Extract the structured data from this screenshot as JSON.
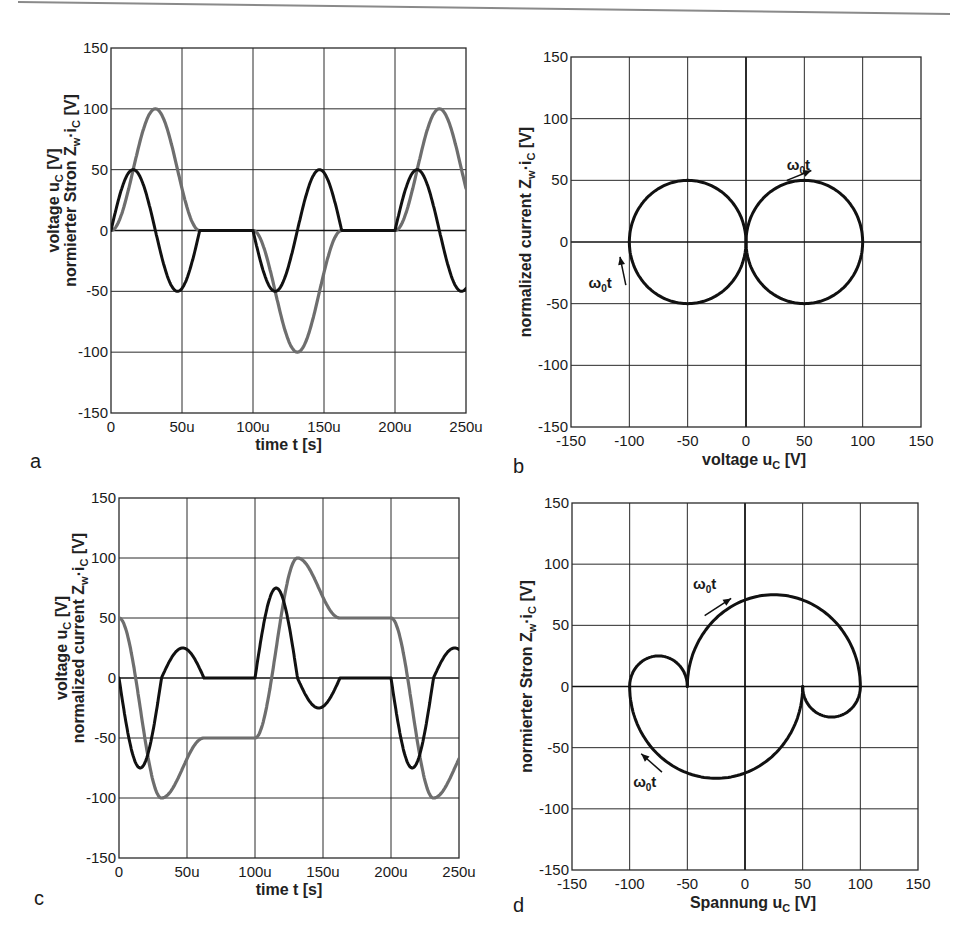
{
  "header": {
    "rule_color": "#8a8a8a"
  },
  "colors": {
    "current": "#111111",
    "voltage": "#6e6e6e"
  },
  "chart_data": [
    {
      "id": "a",
      "panel_label": "a",
      "type": "line",
      "xlabel": "time   t   [s]",
      "ylabel_line1": "voltage   u",
      "ylabel_line1_sub": "C",
      "ylabel_line1_unit": "[V]",
      "ylabel_line2": "normierter Stron   Z",
      "ylabel_line2_sub_w": "w",
      "ylabel_line2_mid": "·i",
      "ylabel_line2_sub_c": "C",
      "ylabel_line2_unit": "[V]",
      "xlim": [
        0,
        250
      ],
      "ylim": [
        -150,
        150
      ],
      "x_unit": "us",
      "xticks": [
        0,
        50,
        100,
        150,
        200,
        250
      ],
      "xtick_labels": [
        "0",
        "50u",
        "100u",
        "150u",
        "200u",
        "250u"
      ],
      "yticks": [
        150,
        100,
        50,
        0,
        -50,
        -100,
        -150
      ],
      "ytick_labels": [
        "150",
        "100",
        "50",
        "0",
        "-50",
        "-100",
        "-150"
      ],
      "grid": true,
      "resonant_period_us": 62.5,
      "series": [
        {
          "name": "u_C (voltage)",
          "color_key": "voltage",
          "segments": [
            {
              "t0": 0,
              "kind": "arc",
              "center_u": -50,
              "center_i": 0,
              "radius": 50,
              "start_deg": 0,
              "sweep_deg": 360,
              "sign": -1
            },
            {
              "t0": 62.5,
              "kind": "hold",
              "u": 0,
              "t1": 100
            },
            {
              "t0": 100,
              "kind": "arc",
              "center_u": 50,
              "center_i": 0,
              "radius": 50,
              "start_deg": 180,
              "sweep_deg": 360,
              "sign": 1
            },
            {
              "t0": 162.5,
              "kind": "hold",
              "u": 0,
              "t1": 200
            },
            {
              "t0": 200,
              "kind": "arc",
              "center_u": -50,
              "center_i": 0,
              "radius": 50,
              "start_deg": 0,
              "sweep_deg": 360,
              "sign": -1
            }
          ]
        },
        {
          "name": "Z_w·i_C (normalized current)",
          "color_key": "current"
        }
      ],
      "key_points": {
        "u_min": -100,
        "u_max": 100,
        "i_peak": 50
      }
    },
    {
      "id": "b",
      "panel_label": "b",
      "type": "line",
      "xlabel": "voltage   u",
      "xlabel_sub": "C",
      "xlabel_unit": "[V]",
      "ylabel": "normalized current   Z",
      "ylabel_sub_w": "w",
      "ylabel_mid": "·i",
      "ylabel_sub_c": "C",
      "ylabel_unit": "[V]",
      "xlim": [
        -150,
        150
      ],
      "ylim": [
        -150,
        150
      ],
      "xticks": [
        -150,
        -100,
        -50,
        0,
        50,
        100,
        150
      ],
      "xtick_labels": [
        "-150",
        "-100",
        "-50",
        "0",
        "50",
        "100",
        "150"
      ],
      "yticks": [
        150,
        100,
        50,
        0,
        -50,
        -100,
        -150
      ],
      "ytick_labels": [
        "150",
        "100",
        "50",
        "0",
        "-50",
        "-100",
        "-150"
      ],
      "grid": true,
      "circles": [
        {
          "center_u": -50,
          "center_i": 0,
          "radius": 50
        },
        {
          "center_u": 50,
          "center_i": 0,
          "radius": 50
        }
      ],
      "annotations": [
        {
          "text": "ω",
          "sub": "0",
          "tail": "t",
          "at_u": 35,
          "at_i": 58,
          "arrow_from": [
            35,
            50
          ],
          "arrow_to": [
            56,
            58
          ]
        },
        {
          "text": "ω",
          "sub": "0",
          "tail": "t",
          "at_u": -135,
          "at_i": -37,
          "arrow_from": [
            -103,
            -35
          ],
          "arrow_to": [
            -108,
            -12
          ]
        }
      ]
    },
    {
      "id": "c",
      "panel_label": "c",
      "type": "line",
      "xlabel": "time   t   [s]",
      "ylabel_line1": "voltage   u",
      "ylabel_line1_sub": "C",
      "ylabel_line1_unit": "[V]",
      "ylabel_line2": "normalized current   Z",
      "ylabel_line2_sub_w": "w",
      "ylabel_line2_mid": "·i",
      "ylabel_line2_sub_c": "C",
      "ylabel_line2_unit": "[V]",
      "xlim": [
        0,
        250
      ],
      "ylim": [
        -150,
        150
      ],
      "x_unit": "us",
      "xticks": [
        0,
        50,
        100,
        150,
        200,
        250
      ],
      "xtick_labels": [
        "0",
        "50u",
        "100u",
        "150u",
        "200u",
        "250u"
      ],
      "yticks": [
        150,
        100,
        50,
        0,
        -50,
        -100,
        -150
      ],
      "ytick_labels": [
        "150",
        "100",
        "50",
        "0",
        "-50",
        "-100",
        "-150"
      ],
      "grid": true,
      "resonant_period_us": 62.5,
      "segments": [
        {
          "t0": 0,
          "dur": 31.25,
          "center_u": -25,
          "radius": 75,
          "start_deg": 0,
          "dir": -1
        },
        {
          "t0": 31.25,
          "dur": 31.25,
          "center_u": -75,
          "radius": 25,
          "start_deg": 180,
          "dir": -1
        },
        {
          "t0": 62.5,
          "dur": 37.5,
          "hold_u": -50
        },
        {
          "t0": 100,
          "dur": 31.25,
          "center_u": 25,
          "radius": 75,
          "start_deg": 180,
          "dir": -1
        },
        {
          "t0": 131.25,
          "dur": 31.25,
          "center_u": 75,
          "radius": 25,
          "start_deg": 0,
          "dir": -1
        },
        {
          "t0": 162.5,
          "dur": 37.5,
          "hold_u": 50
        },
        {
          "t0": 200,
          "dur": 31.25,
          "center_u": -25,
          "radius": 75,
          "start_deg": 0,
          "dir": -1
        },
        {
          "t0": 231.25,
          "dur": 31.25,
          "center_u": -75,
          "radius": 25,
          "start_deg": 180,
          "dir": -1
        }
      ],
      "key_points": {
        "u_start": 50,
        "u_min": -100,
        "u_hold_1": -50,
        "u_max": 100,
        "u_hold_2": 50,
        "i_min": -75,
        "i_max": 75,
        "i_small_peak": 25
      }
    },
    {
      "id": "d",
      "panel_label": "d",
      "type": "line",
      "xlabel": "Spannung   u",
      "xlabel_sub": "C",
      "xlabel_unit": "[V]",
      "ylabel": "normierter Stron   Z",
      "ylabel_sub_w": "w",
      "ylabel_mid": "·i",
      "ylabel_sub_c": "C",
      "ylabel_unit": "[V]",
      "xlim": [
        -150,
        150
      ],
      "ylim": [
        -150,
        150
      ],
      "xticks": [
        -150,
        -100,
        -50,
        0,
        50,
        100,
        150
      ],
      "xtick_labels": [
        "-150",
        "-100",
        "-50",
        "0",
        "50",
        "100",
        "150"
      ],
      "yticks": [
        150,
        100,
        50,
        0,
        -50,
        -100,
        -150
      ],
      "ytick_labels": [
        "150",
        "100",
        "50",
        "0",
        "-50",
        "-100",
        "-150"
      ],
      "grid": true,
      "arcs": [
        {
          "center_u": 25,
          "center_i": 0,
          "radius": 75,
          "from_deg": 180,
          "to_deg": 0,
          "half": "upper"
        },
        {
          "center_u": 75,
          "center_i": 0,
          "radius": 25,
          "from_deg": 0,
          "to_deg": -180,
          "half": "lower"
        },
        {
          "center_u": -25,
          "center_i": 0,
          "radius": 75,
          "from_deg": 0,
          "to_deg": -180,
          "half": "lower"
        },
        {
          "center_u": -75,
          "center_i": 0,
          "radius": 25,
          "from_deg": 180,
          "to_deg": 0,
          "half": "upper"
        }
      ],
      "annotations": [
        {
          "text": "ω",
          "sub": "0",
          "tail": "t",
          "at_u": -45,
          "at_i": 80,
          "arrow_from": [
            -35,
            58
          ],
          "arrow_to": [
            -12,
            72
          ]
        },
        {
          "text": "ω",
          "sub": "0",
          "tail": "t",
          "at_u": -97,
          "at_i": -82,
          "arrow_from": [
            -72,
            -70
          ],
          "arrow_to": [
            -90,
            -55
          ]
        }
      ]
    }
  ]
}
